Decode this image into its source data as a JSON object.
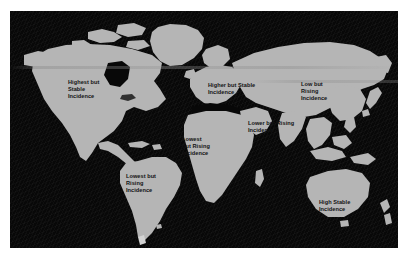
{
  "figure": {
    "type": "choropleth-annotated-world-map",
    "background_color": "#ffffff",
    "ocean_color": "#080808",
    "land_color": "#b5b5b5",
    "label_text_color": "#121212"
  },
  "regions": [
    {
      "id": "north-america",
      "name": "North America",
      "label": "Highest but\nStable\nIncidence",
      "lines": [
        "Highest but",
        "Stable",
        "Incidence"
      ]
    },
    {
      "id": "europe",
      "name": "Europe",
      "label": "Higher but Stable\nIncidence",
      "lines": [
        "Higher but Stable",
        "Incidence"
      ]
    },
    {
      "id": "east-asia",
      "name": "East Asia",
      "label": "Low but\nRising\nIncidence",
      "lines": [
        "Low but",
        "Rising",
        "Incidence"
      ]
    },
    {
      "id": "south-asia",
      "name": "South Asia / Middle East",
      "label": "Lower but  Rising\nIncidence",
      "lines": [
        "Lower but  Rising",
        "Incidence"
      ]
    },
    {
      "id": "africa",
      "name": "Africa",
      "label": "Lowest\nbut Rising\nIncidence",
      "lines": [
        "Lowest",
        "but Rising",
        "Incidence"
      ]
    },
    {
      "id": "south-america",
      "name": "South America",
      "label": "Lowest but\nRising\nIncidence",
      "lines": [
        "Lowest but",
        "Rising",
        "Incidence"
      ]
    },
    {
      "id": "oceania",
      "name": "Oceania / Australia",
      "label": "High Stable\nIncidence",
      "lines": [
        "High Stable",
        "Incidence"
      ]
    }
  ]
}
